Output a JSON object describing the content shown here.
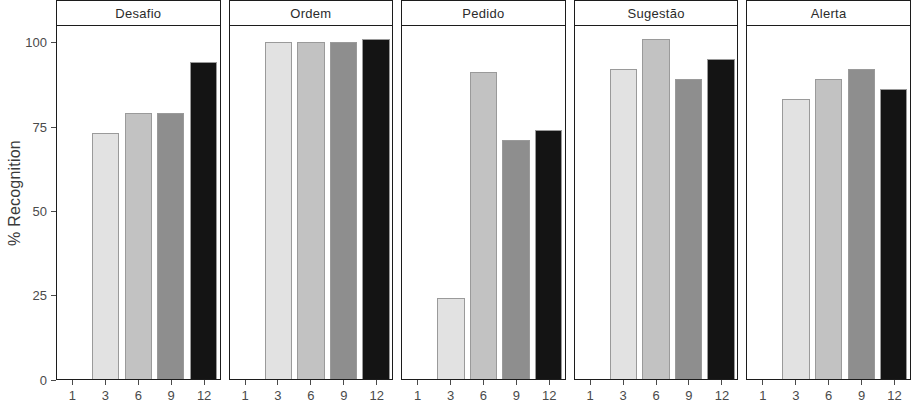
{
  "chart_data": {
    "type": "bar",
    "title": "",
    "subtitle": "",
    "xlabel": "",
    "ylabel": "% Recognition",
    "ylim": [
      0,
      105
    ],
    "yticks": [
      0,
      25,
      50,
      75,
      100
    ],
    "ytick_labels": [
      "0",
      "25",
      "50",
      "75",
      "100"
    ],
    "categories": [
      "1",
      "3",
      "6",
      "9",
      "12"
    ],
    "xtick_labels": [
      "1",
      "3",
      "6",
      "9",
      "12"
    ],
    "facet_variable": "speech act",
    "facets": [
      "Desafio",
      "Ordem",
      "Pedido",
      "Sugestão",
      "Alerta"
    ],
    "grid": false,
    "legend": "none",
    "bar_fill_colors": [
      "#fafafa",
      "#e2e2e2",
      "#c2c2c2",
      "#8e8e8e",
      "#141414"
    ],
    "bar_border_color": "#9a9a9a",
    "panels": [
      {
        "name": "Desafio",
        "categories": [
          "1",
          "3",
          "6",
          "9",
          "12"
        ],
        "values": [
          0,
          73,
          79,
          79,
          94
        ]
      },
      {
        "name": "Ordem",
        "categories": [
          "1",
          "3",
          "6",
          "9",
          "12"
        ],
        "values": [
          0,
          100,
          100,
          100,
          101
        ]
      },
      {
        "name": "Pedido",
        "categories": [
          "1",
          "3",
          "6",
          "9",
          "12"
        ],
        "values": [
          0,
          24,
          91,
          71,
          74
        ]
      },
      {
        "name": "Sugestão",
        "categories": [
          "1",
          "3",
          "6",
          "9",
          "12"
        ],
        "values": [
          0,
          92,
          101,
          89,
          95
        ]
      },
      {
        "name": "Alerta",
        "categories": [
          "1",
          "3",
          "6",
          "9",
          "12"
        ],
        "values": [
          0,
          83,
          89,
          92,
          86
        ]
      }
    ]
  },
  "axis": {
    "y_title": "% Recognition",
    "y_tick_labels": [
      "100",
      "75",
      "50",
      "25",
      "0"
    ],
    "x_tick_labels": [
      "1",
      "3",
      "6",
      "9",
      "12"
    ]
  },
  "strips": {
    "labels": [
      "Desafio",
      "Ordem",
      "Pedido",
      "Sugestão",
      "Alerta"
    ]
  }
}
